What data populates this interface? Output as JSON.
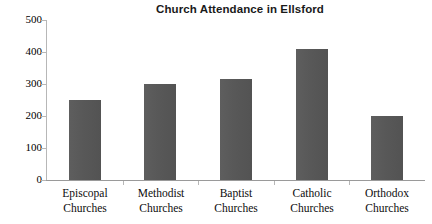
{
  "chart_data": {
    "type": "bar",
    "title": "Church Attendance in Ellsford",
    "xlabel": "",
    "ylabel": "",
    "categories": [
      "Episcopal Churches",
      "Methodist Churches",
      "Baptist Churches",
      "Catholic Churches",
      "Orthodox Churches"
    ],
    "category_lines": [
      [
        "Episcopal",
        "Churches"
      ],
      [
        "Methodist",
        "Churches"
      ],
      [
        "Baptist",
        "Churches"
      ],
      [
        "Catholic",
        "Churches"
      ],
      [
        "Orthodox",
        "Churches"
      ]
    ],
    "values": [
      250,
      300,
      315,
      410,
      200
    ],
    "ylim": [
      0,
      500
    ],
    "yticks": [
      0,
      100,
      200,
      300,
      400,
      500
    ],
    "ytick_labels": [
      "0",
      "100",
      "200",
      "300",
      "400",
      "500"
    ],
    "grid": false,
    "legend": null,
    "bar_color": "#595959",
    "axis_color": "#b7b7b7",
    "text_color": "#000000",
    "background": "#ffffff"
  }
}
